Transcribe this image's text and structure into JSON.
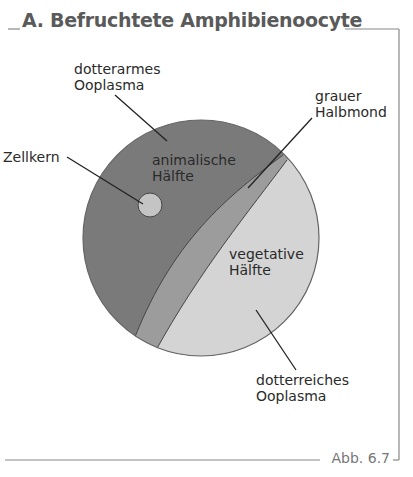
{
  "figure": {
    "title": "A. Befruchtete Amphibienoocyte",
    "caption": "Abb. 6.7"
  },
  "labels": {
    "dotterarmes": "dotterarmes",
    "dotterarmes_2": "Ooplasma",
    "zellkern": "Zellkern",
    "animalisch_1": "animalische",
    "animalisch_2": "Hälfte",
    "grauer_1": "grauer",
    "grauer_2": "Halbmond",
    "vegetativ_1": "vegetative",
    "vegetativ_2": "Hälfte",
    "dotterreich_1": "dotterreiches",
    "dotterreich_2": "Ooplasma"
  },
  "colors": {
    "animal_half": "#7a7a7a",
    "gray_crescent": "#9c9c9c",
    "vegetal_half": "#d4d4d4",
    "nucleus": "#c4c4c4",
    "frame": "#888888"
  }
}
